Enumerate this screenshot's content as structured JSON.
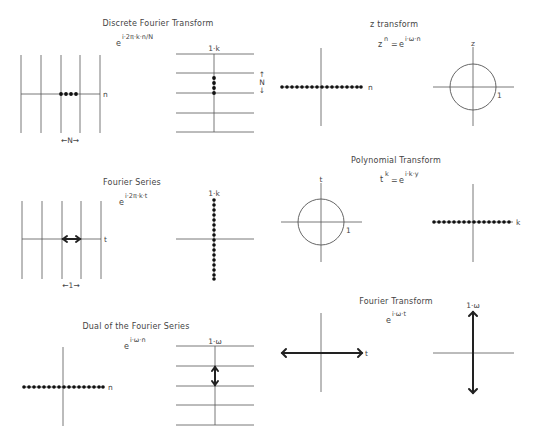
{
  "panels": {
    "dft": {
      "title": "Discrete Fourier Transform",
      "formula_base": "e",
      "formula_exp": "i·2π·k·n/N",
      "left_axis_label": "n",
      "left_period_label": "←N→",
      "right_axis_label": "1·k",
      "right_period_label_top": "↑",
      "right_period_label_mid": "N",
      "right_period_label_bot": "↓"
    },
    "z_transform": {
      "title": "z transform",
      "formula_lhs_base": "z",
      "formula_lhs_exp": "n",
      "formula_eq": "=",
      "formula_base": "e",
      "formula_exp": "i·ω·n",
      "left_axis_label": "n",
      "right_axis_label": "z",
      "unit_label": "1"
    },
    "fourier_series": {
      "title": "Fourier Series",
      "formula_base": "e",
      "formula_exp": "i·2π·k·t",
      "left_axis_label": "t",
      "left_period_label": "←1→",
      "right_axis_label": "1·k"
    },
    "polynomial_transform": {
      "title": "Polynomial Transform",
      "formula_lhs_base": "t",
      "formula_lhs_exp": "k",
      "formula_eq": "=",
      "formula_base": "e",
      "formula_exp": "i·k·y",
      "left_axis_label": "t",
      "unit_label": "1",
      "right_axis_label": "k"
    },
    "dual_fourier_series": {
      "title": "Dual of the Fourier Series",
      "formula_base": "e",
      "formula_exp": "i·ω·n",
      "left_axis_label": "n",
      "right_axis_label": "1·ω"
    },
    "fourier_transform": {
      "title": "Fourier Transform",
      "formula_base": "e",
      "formula_exp": "i·ω·t",
      "left_axis_label": "t",
      "right_axis_label": "1·ω"
    }
  },
  "colors": {
    "background": "#ffffff",
    "line": "#555555",
    "dots": "#111111",
    "text": "#444444"
  }
}
